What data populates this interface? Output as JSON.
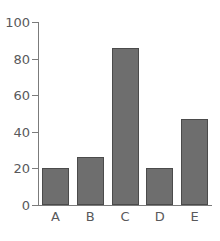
{
  "chart_data": {
    "type": "bar",
    "title": "",
    "subtitle": "",
    "xlabel": "",
    "ylabel": "",
    "categories": [
      "A",
      "B",
      "C",
      "D",
      "E"
    ],
    "values": [
      20,
      26,
      86,
      20,
      47
    ],
    "ylim": [
      0,
      100
    ],
    "y_ticks": [
      0,
      20,
      40,
      60,
      80,
      100
    ],
    "y_tick_labels": [
      "0",
      "20",
      "40",
      "60",
      "80",
      "100"
    ],
    "grid": false,
    "legend": null,
    "legend_position": "none",
    "annotations": [],
    "bar_color": "#6e6e6e",
    "bar_edge_color": "#4b4b4b",
    "axis_color": "#7b7b7b",
    "tick_label_color": "#59595b",
    "background_color": "#ffffff"
  }
}
